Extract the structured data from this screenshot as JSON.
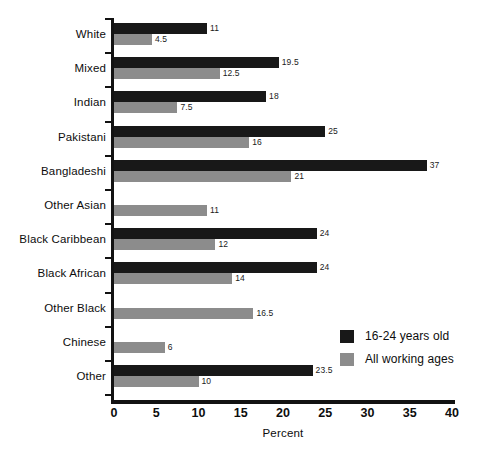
{
  "chart_data": {
    "type": "bar",
    "orientation": "horizontal",
    "title": "",
    "xlabel": "Percent",
    "ylabel": "",
    "xlim": [
      0,
      40
    ],
    "xticks": [
      0,
      5,
      10,
      15,
      20,
      25,
      30,
      35,
      40
    ],
    "xticklabels": [
      "0",
      "5",
      "10",
      "15",
      "20",
      "25",
      "30",
      "35",
      "40"
    ],
    "grid": false,
    "legend_position": "lower-right",
    "categories": [
      "White",
      "Mixed",
      "Indian",
      "Pakistani",
      "Bangladeshi",
      "Other Asian",
      "Black Caribbean",
      "Black African",
      "Other Black",
      "Chinese",
      "Other"
    ],
    "series": [
      {
        "name": "16-24 years old",
        "color": "#181818",
        "values": [
          11,
          19.5,
          18,
          25,
          37,
          null,
          24,
          24,
          null,
          null,
          23.5
        ],
        "labels": [
          "11",
          "19.5",
          "18",
          "25",
          "37",
          "",
          "24",
          "24",
          "",
          "",
          "23.5"
        ]
      },
      {
        "name": "All working ages",
        "color": "#8c8c8c",
        "values": [
          4.5,
          12.5,
          7.5,
          16,
          21,
          11,
          12,
          14,
          16.5,
          6,
          10
        ],
        "labels": [
          "4.5",
          "12.5",
          "7.5",
          "16",
          "21",
          "11",
          "12",
          "14",
          "16.5",
          "6",
          "10"
        ]
      }
    ]
  },
  "legend": {
    "entries": [
      {
        "label": "16-24 years old",
        "color": "#181818"
      },
      {
        "label": "All working ages",
        "color": "#8c8c8c"
      }
    ]
  },
  "axis": {
    "x_title": "Percent"
  }
}
